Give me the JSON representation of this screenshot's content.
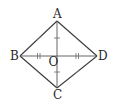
{
  "figure": {
    "type": "rhombus-with-diagonals",
    "vertices": {
      "A": {
        "label": "A",
        "x": 57,
        "y": 21
      },
      "B": {
        "label": "B",
        "x": 20,
        "y": 56
      },
      "C": {
        "label": "C",
        "x": 57,
        "y": 88
      },
      "D": {
        "label": "D",
        "x": 97,
        "y": 56
      }
    },
    "center": {
      "label": "O",
      "x": 57,
      "y": 56
    },
    "sides": [
      "AB",
      "BC",
      "CD",
      "DA"
    ],
    "diagonals": [
      "AC",
      "BD"
    ],
    "markings": {
      "sides": "single tick on each side (all sides equal)",
      "AO_OC": "single tick (AO = OC)",
      "BO_OD": "double tick (BO = OD)"
    },
    "colors": {
      "line": "#3a3a3a",
      "label": "#2a2a2a",
      "background": "#ffffff"
    }
  }
}
